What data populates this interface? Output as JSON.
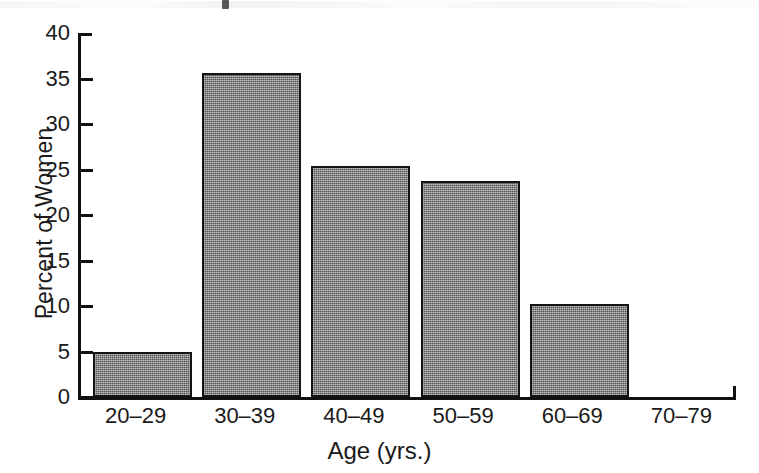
{
  "figure": {
    "background_color": "#ffffff",
    "ink_color": "#141414",
    "bar_fill_color": "#7d7d7d",
    "has_title": false,
    "scan_artifact_present": true
  },
  "chart_data": {
    "type": "bar",
    "title": "",
    "xlabel": "Age (yrs.)",
    "ylabel": "Percent of Women",
    "categories": [
      "20–29",
      "30–39",
      "40–49",
      "50–59",
      "60–69",
      "70–79"
    ],
    "values": [
      5.0,
      35.6,
      25.4,
      23.7,
      10.2,
      0.0
    ],
    "ylim": [
      0,
      40
    ],
    "yticks": [
      0,
      5,
      10,
      15,
      20,
      25,
      30,
      35,
      40
    ],
    "ytick_labels": [
      "0",
      "5",
      "10",
      "15",
      "20",
      "25",
      "30",
      "35",
      "40"
    ],
    "grid": false,
    "legend": false,
    "legend_position": "none",
    "orientation": "vertical",
    "bar_style": "filled-gray-dither-with-black-outline"
  }
}
